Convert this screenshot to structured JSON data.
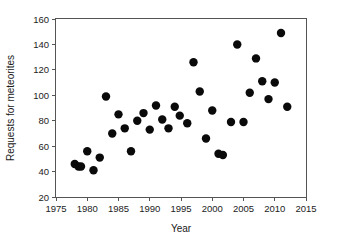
{
  "chart_data": {
    "type": "scatter",
    "title": "",
    "xlabel": "Year",
    "ylabel": "Requests for meteorites",
    "xlim": [
      1975,
      2015
    ],
    "ylim": [
      20,
      160
    ],
    "xticks": [
      1975,
      1980,
      1985,
      1990,
      1995,
      2000,
      2005,
      2010,
      2015
    ],
    "yticks": [
      20,
      40,
      60,
      80,
      100,
      120,
      140,
      160
    ],
    "grid": false,
    "legend": null,
    "marker": {
      "shape": "circle",
      "color": "#0a0a0a",
      "size": 4.2
    },
    "series": [
      {
        "name": "Requests for meteorites",
        "points": [
          {
            "x": 1978.0,
            "y": 46
          },
          {
            "x": 1978.6,
            "y": 44
          },
          {
            "x": 1979.0,
            "y": 44
          },
          {
            "x": 1980.0,
            "y": 56
          },
          {
            "x": 1981.0,
            "y": 41
          },
          {
            "x": 1982.0,
            "y": 51
          },
          {
            "x": 1983.0,
            "y": 99
          },
          {
            "x": 1984.0,
            "y": 70
          },
          {
            "x": 1985.0,
            "y": 85
          },
          {
            "x": 1986.0,
            "y": 74
          },
          {
            "x": 1987.0,
            "y": 56
          },
          {
            "x": 1988.0,
            "y": 80
          },
          {
            "x": 1989.0,
            "y": 86
          },
          {
            "x": 1990.0,
            "y": 73
          },
          {
            "x": 1991.0,
            "y": 92
          },
          {
            "x": 1992.0,
            "y": 81
          },
          {
            "x": 1993.0,
            "y": 74
          },
          {
            "x": 1994.0,
            "y": 91
          },
          {
            "x": 1994.8,
            "y": 84
          },
          {
            "x": 1996.0,
            "y": 78
          },
          {
            "x": 1997.0,
            "y": 126
          },
          {
            "x": 1998.0,
            "y": 103
          },
          {
            "x": 1999.0,
            "y": 66
          },
          {
            "x": 2000.0,
            "y": 88
          },
          {
            "x": 2001.0,
            "y": 54
          },
          {
            "x": 2001.7,
            "y": 53
          },
          {
            "x": 2003.0,
            "y": 79
          },
          {
            "x": 2004.0,
            "y": 140
          },
          {
            "x": 2005.0,
            "y": 79
          },
          {
            "x": 2006.0,
            "y": 102
          },
          {
            "x": 2007.0,
            "y": 129
          },
          {
            "x": 2008.0,
            "y": 111
          },
          {
            "x": 2009.0,
            "y": 97
          },
          {
            "x": 2010.0,
            "y": 110
          },
          {
            "x": 2011.0,
            "y": 149
          },
          {
            "x": 2012.0,
            "y": 91
          }
        ]
      }
    ]
  },
  "axes": {
    "x_title": "Year",
    "y_title": "Requests for meteorites",
    "x_tick_labels": [
      "1975",
      "1980",
      "1985",
      "1990",
      "1995",
      "2000",
      "2005",
      "2010",
      "2015"
    ],
    "y_tick_labels": [
      "20",
      "40",
      "60",
      "80",
      "100",
      "120",
      "140",
      "160"
    ]
  },
  "colors": {
    "background": "#ffffff",
    "marker": "#0a0a0a",
    "axis": "#555555",
    "text": "#1a1a1a"
  }
}
